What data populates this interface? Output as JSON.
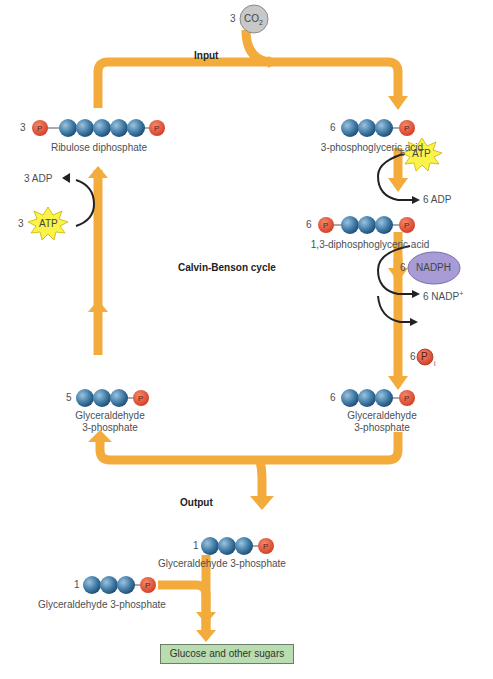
{
  "diagram": {
    "title": "Calvin-Benson cycle",
    "input_label": "Input",
    "output_label": "Output",
    "co2": {
      "count": "3",
      "formula": "CO",
      "subscript": "2"
    },
    "molecules": {
      "ribulose": {
        "count": "3",
        "name": "Ribulose diphosphate",
        "carbons": 5,
        "phosphates": 2
      },
      "pga": {
        "count": "6",
        "name": "3-phosphoglyceric acid",
        "carbons": 3,
        "phosphates": 1
      },
      "dpga": {
        "count": "6",
        "name": "1,3-diphosphoglyceric acid",
        "carbons": 3,
        "phosphates": 2
      },
      "g3p_right": {
        "count": "6",
        "name_line1": "Glyceraldehyde",
        "name_line2": "3-phosphate"
      },
      "g3p_left": {
        "count": "5",
        "name_line1": "Glyceraldehyde",
        "name_line2": "3-phosphate"
      },
      "g3p_output": {
        "count": "1",
        "name": "Glyceraldehyde 3-phosphate"
      },
      "g3p_extra": {
        "count": "1",
        "name": "Glyceraldehyde 3-phosphate"
      }
    },
    "cofactors": {
      "atp_right": {
        "count": "6",
        "label": "ATP"
      },
      "adp_right": {
        "label": "6 ADP"
      },
      "nadph": {
        "count": "6",
        "label": "NADPH"
      },
      "nadp": {
        "label": "6 NADP",
        "superscript": "+"
      },
      "pi": {
        "count": "6",
        "label": "P",
        "subscript": "i"
      },
      "adp_left": {
        "label": "3 ADP"
      },
      "atp_left": {
        "count": "3",
        "label": "ATP"
      }
    },
    "phosphate_label": "P",
    "product": "Glucose and other sugars"
  },
  "colors": {
    "arrow": "#f3ab3c",
    "carbon": "#3f7aa6",
    "phosphate": "#e0533a",
    "atp": "#fbf24a",
    "nadph": "#a99bd6",
    "co2": "#c8c8c8",
    "product_box": "#b9dcb0"
  }
}
